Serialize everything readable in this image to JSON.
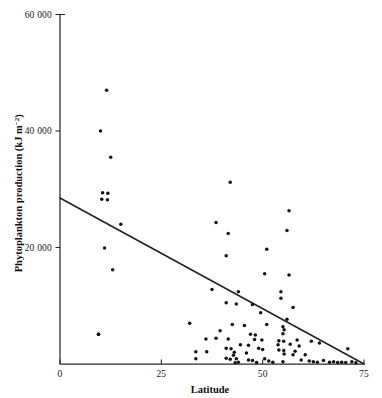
{
  "chart_data": {
    "type": "scatter",
    "title": "",
    "xlabel": "Latitude",
    "ylabel": "Phytoplankton production (kJ m⁻²)",
    "ylabel_main": "Phytoplankton production (kJ m",
    "ylabel_sup": "−2",
    "ylabel_tail": ")",
    "xlim": [
      0,
      75
    ],
    "ylim": [
      0,
      60000
    ],
    "xticks": [
      0,
      25,
      50,
      75
    ],
    "xticklabels": [
      "0",
      "25",
      "50",
      "75"
    ],
    "yticks": [
      20000,
      40000,
      60000
    ],
    "yticklabels": [
      "20 000",
      "40 000",
      "60 000"
    ],
    "grid": false,
    "legend": null,
    "marker_color": "#121212",
    "line_color": "#202020",
    "axis_color": "#2b2b2b",
    "fit_line": {
      "label": "regression line",
      "x": [
        0,
        75
      ],
      "y": [
        28500,
        0
      ],
      "intercept": 28500,
      "slope": -380
    },
    "points": [
      [
        11.5,
        47000
      ],
      [
        10.0,
        40000
      ],
      [
        12.5,
        35500
      ],
      [
        10.5,
        29400
      ],
      [
        11.8,
        29300
      ],
      [
        10.3,
        28300
      ],
      [
        11.7,
        28200
      ],
      [
        15.0,
        24000
      ],
      [
        11.0,
        19900
      ],
      [
        13.0,
        16200
      ],
      [
        9.5,
        5100
      ],
      [
        42.0,
        31200
      ],
      [
        38.5,
        24300
      ],
      [
        41.5,
        22400
      ],
      [
        56.5,
        26300
      ],
      [
        56.0,
        22900
      ],
      [
        51.0,
        19700
      ],
      [
        41.0,
        18600
      ],
      [
        50.5,
        15500
      ],
      [
        56.5,
        15300
      ],
      [
        37.5,
        12800
      ],
      [
        44.0,
        12400
      ],
      [
        54.5,
        12400
      ],
      [
        54.5,
        11300
      ],
      [
        41.0,
        10500
      ],
      [
        43.5,
        10300
      ],
      [
        47.5,
        10200
      ],
      [
        57.5,
        9700
      ],
      [
        49.5,
        8800
      ],
      [
        56.0,
        7700
      ],
      [
        32.0,
        7000
      ],
      [
        42.5,
        6800
      ],
      [
        51.0,
        6800
      ],
      [
        45.5,
        6600
      ],
      [
        55.0,
        6400
      ],
      [
        55.3,
        5900
      ],
      [
        39.5,
        5700
      ],
      [
        55.0,
        5200
      ],
      [
        47.0,
        5100
      ],
      [
        48.2,
        5000
      ],
      [
        9.5,
        5100
      ],
      [
        36.0,
        4300
      ],
      [
        38.5,
        4400
      ],
      [
        41.5,
        4300
      ],
      [
        48.0,
        4200
      ],
      [
        49.8,
        4100
      ],
      [
        54.0,
        4000
      ],
      [
        58.5,
        4100
      ],
      [
        55.2,
        3900
      ],
      [
        62.0,
        3900
      ],
      [
        64.0,
        3600
      ],
      [
        44.5,
        3300
      ],
      [
        46.5,
        3200
      ],
      [
        53.8,
        3300
      ],
      [
        56.8,
        3400
      ],
      [
        59.0,
        3100
      ],
      [
        41.0,
        2700
      ],
      [
        42.2,
        2600
      ],
      [
        49.0,
        2700
      ],
      [
        50.0,
        2500
      ],
      [
        54.0,
        2400
      ],
      [
        55.2,
        2300
      ],
      [
        58.0,
        2200
      ],
      [
        36.2,
        2100
      ],
      [
        43.0,
        2000
      ],
      [
        46.0,
        1900
      ],
      [
        55.3,
        1700
      ],
      [
        57.5,
        1600
      ],
      [
        60.5,
        1600
      ],
      [
        71.0,
        2600
      ],
      [
        33.5,
        2100
      ],
      [
        33.5,
        900
      ],
      [
        41.0,
        1000
      ],
      [
        42.0,
        800
      ],
      [
        43.5,
        900
      ],
      [
        46.5,
        700
      ],
      [
        47.5,
        600
      ],
      [
        50.5,
        900
      ],
      [
        51.5,
        500
      ],
      [
        55.0,
        400
      ],
      [
        59.5,
        700
      ],
      [
        61.5,
        500
      ],
      [
        62.5,
        400
      ],
      [
        63.5,
        300
      ],
      [
        65.0,
        600
      ],
      [
        66.5,
        300
      ],
      [
        67.5,
        400
      ],
      [
        68.5,
        250
      ],
      [
        69.5,
        300
      ],
      [
        70.5,
        250
      ],
      [
        72.0,
        400
      ],
      [
        73.0,
        200
      ],
      [
        44.0,
        300
      ],
      [
        48.5,
        250
      ],
      [
        52.5,
        300
      ],
      [
        42.8,
        1500
      ],
      [
        43.2,
        200
      ]
    ]
  }
}
